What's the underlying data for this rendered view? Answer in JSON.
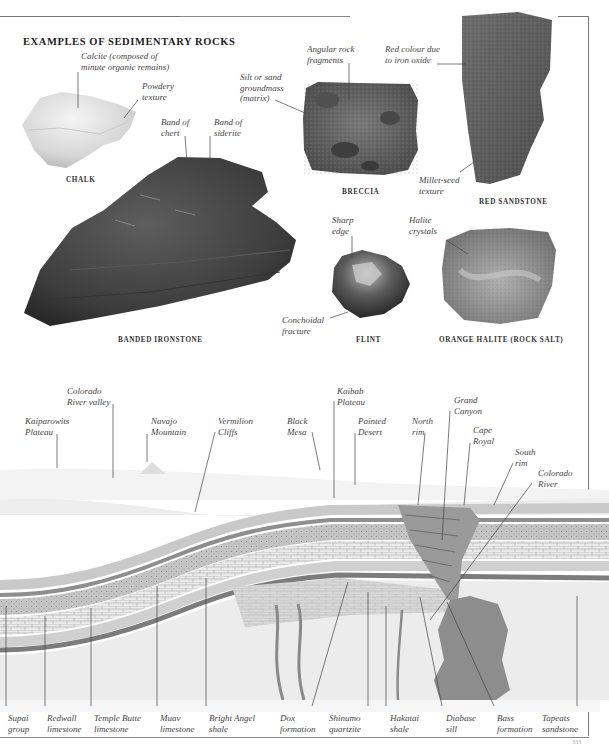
{
  "page": {
    "title": "EXAMPLES OF SEDIMENTARY ROCKS",
    "page_number": "333"
  },
  "rocks": [
    {
      "name": "CHALK",
      "labels": [
        "Calcite (composed of",
        "minute organic remains)",
        "Powdery",
        "texture"
      ]
    },
    {
      "name": "BRECCIA",
      "labels": [
        "Angular rock",
        "fragments",
        "Silt or sand",
        "groundmass",
        "(matrix)"
      ]
    },
    {
      "name": "RED SANDSTONE",
      "labels": [
        "Red colour due",
        "to iron oxide",
        "Millet-seed",
        "texture"
      ]
    },
    {
      "name": "BANDED IRONSTONE",
      "labels": [
        "Band of",
        "chert",
        "Band of",
        "siderite"
      ]
    },
    {
      "name": "FLINT",
      "labels": [
        "Sharp",
        "edge",
        "Conchoidal",
        "fracture"
      ]
    },
    {
      "name": "ORANGE HALITE (ROCK SALT)",
      "labels": [
        "Halite",
        "crystals"
      ]
    }
  ],
  "chalk": {
    "caption": "CHALK",
    "l1a": "Calcite (composed of",
    "l1b": "minute organic remains)",
    "l2a": "Powdery",
    "l2b": "texture"
  },
  "breccia": {
    "caption": "BRECCIA",
    "l1a": "Angular rock",
    "l1b": "fragments",
    "l2a": "Silt or sand",
    "l2b": "groundmass",
    "l2c": "(matrix)"
  },
  "sandstone": {
    "caption": "RED SANDSTONE",
    "l1a": "Red colour due",
    "l1b": "to iron oxide",
    "l2a": "Millet-seed",
    "l2b": "texture"
  },
  "ironstone": {
    "caption": "BANDED IRONSTONE",
    "l1a": "Band of",
    "l1b": "chert",
    "l2a": "Band of",
    "l2b": "siderite"
  },
  "flint": {
    "caption": "FLINT",
    "l1a": "Sharp",
    "l1b": "edge",
    "l2a": "Conchoidal",
    "l2b": "fracture"
  },
  "halite": {
    "caption": "ORANGE HALITE (ROCK SALT)",
    "l1a": "Halite",
    "l1b": "crystals"
  },
  "cross_section": {
    "top_labels": [
      {
        "a": "Kaiparowits",
        "b": "Plateau"
      },
      {
        "a": "Colorado",
        "b": "River valley"
      },
      {
        "a": "Navajo",
        "b": "Mountain"
      },
      {
        "a": "Vermilion",
        "b": "Cliffs"
      },
      {
        "a": "Black",
        "b": "Mesa"
      },
      {
        "a": "Kaibab",
        "b": "Plateau"
      },
      {
        "a": "Painted",
        "b": "Desert"
      },
      {
        "a": "North",
        "b": "rim"
      },
      {
        "a": "Grand",
        "b": "Canyon"
      },
      {
        "a": "Cape",
        "b": "Royal"
      },
      {
        "a": "South",
        "b": "rim"
      },
      {
        "a": "Colorado",
        "b": "River"
      }
    ],
    "bottom_labels": [
      {
        "a": "Supai",
        "b": "group"
      },
      {
        "a": "Redwall",
        "b": "limestone"
      },
      {
        "a": "Temple Butte",
        "b": "limestone"
      },
      {
        "a": "Muav",
        "b": "limestone"
      },
      {
        "a": "Bright Angel",
        "b": "shale"
      },
      {
        "a": "Dox",
        "b": "formation"
      },
      {
        "a": "Shinumo",
        "b": "quartzite"
      },
      {
        "a": "Hakatai",
        "b": "shale"
      },
      {
        "a": "Diabase",
        "b": "sill"
      },
      {
        "a": "Bass",
        "b": "formation"
      },
      {
        "a": "Tapeats",
        "b": "sandstone"
      }
    ]
  }
}
